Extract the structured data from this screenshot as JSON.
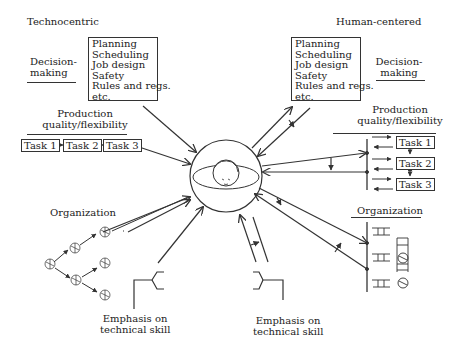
{
  "left": {
    "title": "Technocentric",
    "decision": {
      "line1": "Decision-",
      "line2": "making"
    },
    "list": [
      "Planning",
      "Scheduling",
      "Job design",
      "Safety",
      "Rules and regs.",
      "etc."
    ],
    "production": {
      "line1": "Production",
      "line2": "quality/flexibility"
    },
    "tasks": [
      "Task 1",
      "Task 2",
      "Task 3"
    ],
    "organization": "Organization",
    "skill": {
      "line1": "Emphasis on",
      "line2": "technical skill"
    }
  },
  "right": {
    "title": "Human-centered",
    "decision": {
      "line1": "Decision-",
      "line2": "making"
    },
    "list": [
      "Planning",
      "Scheduling",
      "Job design",
      "Safety",
      "Rules and regs.",
      "etc."
    ],
    "production": {
      "line1": "Production",
      "line2": "quality/flexibility"
    },
    "tasks": [
      "Task 1",
      "Task 2",
      "Task 3"
    ],
    "organization": "Organization",
    "skill": {
      "line1": "Emphasis on",
      "line2": "technical skill"
    }
  },
  "center": {
    "icon": "human-face-icon"
  },
  "colors": {
    "line": "#333333",
    "background": "#ffffff"
  }
}
